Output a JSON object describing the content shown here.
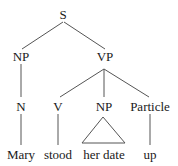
{
  "tree": {
    "root": "S",
    "nodes": {
      "s": "S",
      "np_subject": "NP",
      "vp": "VP",
      "n": "N",
      "v": "V",
      "np_object": "NP",
      "particle": "Particle"
    },
    "leaves": {
      "mary": "Mary",
      "stood": "stood",
      "her_date": "her date",
      "up": "up"
    }
  },
  "colors": {
    "text": "#1a1a1a",
    "lines": "#555555",
    "background": "#ffffff"
  }
}
